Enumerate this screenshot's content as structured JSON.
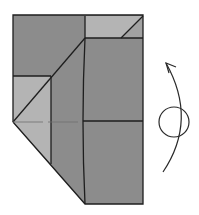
{
  "diagram": {
    "type": "origami-fold-step",
    "colors": {
      "background": "#ffffff",
      "paper_dark": "#8c8c8c",
      "paper_light": "#b4b4b4",
      "line": "#1e1e1e",
      "crease": "#6e6e6e"
    },
    "symbols": {
      "turn_over": "turn-over-arrow-icon",
      "circle": "rotation-circle-icon"
    }
  }
}
